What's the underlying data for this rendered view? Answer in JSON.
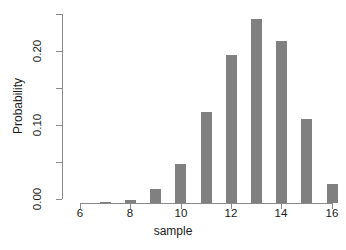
{
  "chart_data": {
    "type": "bar",
    "title": "",
    "xlabel": "sample",
    "ylabel": "Probability",
    "categories": [
      6,
      7,
      8,
      9,
      10,
      11,
      12,
      13,
      14,
      15,
      16
    ],
    "values": [
      0.0,
      0.001,
      0.004,
      0.018,
      0.052,
      0.121,
      0.196,
      0.243,
      0.214,
      0.111,
      0.025
    ],
    "series": [
      {
        "name": "Probability",
        "values": [
          0.0,
          0.001,
          0.004,
          0.018,
          0.052,
          0.121,
          0.196,
          0.243,
          0.214,
          0.111,
          0.025
        ]
      }
    ],
    "xlim": [
      6,
      16
    ],
    "ylim": [
      0.0,
      0.25
    ],
    "xticks": [
      6,
      8,
      10,
      12,
      14,
      16
    ],
    "xtick_labels": [
      "6",
      "8",
      "10",
      "12",
      "14",
      "16"
    ],
    "yticks": [
      0.0,
      0.05,
      0.1,
      0.15,
      0.2,
      0.25
    ],
    "ytick_labels": [
      "0.00",
      "",
      "0.10",
      "",
      "0.20",
      ""
    ],
    "grid": false,
    "legend": false,
    "bar_color": "#808080",
    "axis_color": "#888888",
    "background": "#ffffff"
  },
  "axis": {
    "y_tick_labels": [
      "0.20",
      "0.10",
      "0.00"
    ],
    "x_tick_labels": [
      "6",
      "8",
      "10",
      "12",
      "14",
      "16"
    ],
    "y_title": "Probability",
    "x_title": "sample"
  }
}
